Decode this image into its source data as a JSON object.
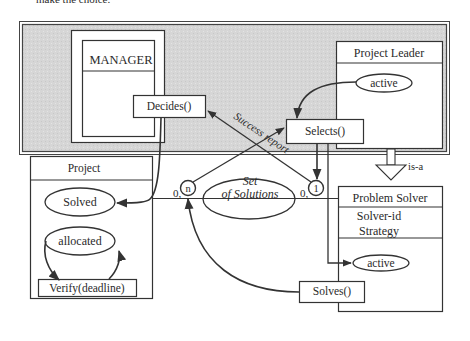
{
  "caption_fragment": "make the choice.",
  "colors": {
    "background": "#d9d9d9",
    "box_fill": "#ffffff",
    "stroke": "#333333",
    "text": "#2a2a2a"
  },
  "diagram": {
    "manager": {
      "title": "MANAGER",
      "operation": "Decides()"
    },
    "project_leader": {
      "title": "Project Leader",
      "state": "active",
      "operation": "Selects()"
    },
    "project": {
      "title": "Project",
      "state_solved": "Solved",
      "state_allocated": "allocated",
      "operation": "Verify(deadline)"
    },
    "problem_solver": {
      "title": "Problem Solver",
      "attr_1": "Solver-id",
      "attr_2": "Strategy",
      "state": "active",
      "operation": "Solves()"
    },
    "relationship": {
      "line1": "Set",
      "line2": "of Solutions"
    },
    "cardinality": {
      "left_min": "0,",
      "left_max": "n",
      "right_min": "0,",
      "right_max": "1"
    },
    "labels": {
      "success_report": "Success report",
      "is_a": "is-a"
    }
  }
}
